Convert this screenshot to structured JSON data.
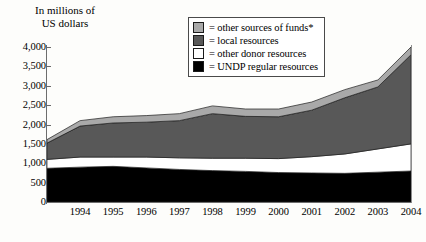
{
  "axis_title": "In millions of\nUS dollars",
  "legend": {
    "items": [
      {
        "label": "= other sources of funds*",
        "color": "#a9a9a9",
        "key": "other_sources"
      },
      {
        "label": "= local resources",
        "color": "#585858",
        "key": "local"
      },
      {
        "label": "= other donor resources",
        "color": "#ffffff",
        "key": "other_donor"
      },
      {
        "label": "= UNDP regular resources",
        "color": "#000000",
        "key": "undp_regular"
      }
    ]
  },
  "chart_data": {
    "type": "area",
    "title": "",
    "subtitle": "",
    "xlabel": "",
    "ylabel": "In millions of US dollars",
    "stacked": true,
    "grid": false,
    "legend_position": "top-right",
    "ylim": [
      0,
      4000
    ],
    "yticks": [
      "0",
      "500",
      "1,000",
      "1,500",
      "2,000",
      "2,500",
      "3,000",
      "3,500",
      "4,000"
    ],
    "ytick_values": [
      0,
      500,
      1000,
      1500,
      2000,
      2500,
      3000,
      3500,
      4000
    ],
    "categories": [
      "1993",
      "1994",
      "1995",
      "1996",
      "1997",
      "1998",
      "1999",
      "2000",
      "2001",
      "2002",
      "2003",
      "2004"
    ],
    "xtick_labels": [
      "1994",
      "1995",
      "1996",
      "1997",
      "1998",
      "1999",
      "2000",
      "2001",
      "2002",
      "2003",
      "2004"
    ],
    "series": [
      {
        "name": "UNDP regular resources",
        "color": "#000000",
        "values": [
          870,
          900,
          920,
          880,
          840,
          810,
          790,
          760,
          750,
          740,
          770,
          800
        ]
      },
      {
        "name": "other donor resources",
        "color": "#ffffff",
        "values": [
          230,
          260,
          240,
          280,
          300,
          320,
          340,
          360,
          420,
          500,
          600,
          700
        ]
      },
      {
        "name": "local resources",
        "color": "#585858",
        "values": [
          420,
          800,
          880,
          900,
          960,
          1150,
          1080,
          1080,
          1200,
          1450,
          1600,
          2300
        ]
      },
      {
        "name": "other sources of funds*",
        "color": "#a9a9a9",
        "values": [
          90,
          140,
          160,
          170,
          180,
          200,
          190,
          200,
          210,
          210,
          180,
          200
        ]
      }
    ],
    "totals": [
      1610,
      2100,
      2200,
      2230,
      2280,
      2480,
      2400,
      2400,
      2580,
      2900,
      3150,
      4000
    ],
    "footnote_marker": "*"
  }
}
